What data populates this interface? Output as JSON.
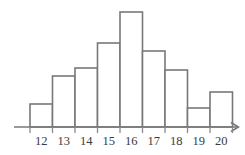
{
  "chart_data": {
    "type": "bar",
    "title": "",
    "subtitle": "",
    "xlabel": "",
    "ylabel": "",
    "categories": [
      "12",
      "13",
      "14",
      "15",
      "16",
      "17",
      "18",
      "19",
      "20"
    ],
    "values": [
      23,
      51,
      59,
      84,
      115,
      76,
      57,
      19,
      35
    ],
    "series": [
      {
        "name": "frequency",
        "values": [
          23,
          51,
          59,
          84,
          115,
          76,
          57,
          19,
          35
        ]
      }
    ],
    "x": [
      12,
      13,
      14,
      15,
      16,
      17,
      18,
      19,
      20
    ],
    "xlim": [
      11.5,
      20.5
    ],
    "ylim": [
      0,
      130
    ],
    "grid": false,
    "legend": null,
    "legend_position": "none",
    "annotations": [],
    "bar_style": "outlined",
    "bar_fill": "#ffffff",
    "bar_stroke": "#787878",
    "axis_color": "#787878",
    "tick_color": "#8a8a8a",
    "label_color": "#3a3a3a",
    "background": "#ffffff",
    "x_axis_has_arrow": true,
    "y_axis_shown": false,
    "tick_marks_between_bars": true
  },
  "axis": {
    "x_tick_labels": [
      "12",
      "13",
      "14",
      "15",
      "16",
      "17",
      "18",
      "19",
      "20"
    ],
    "arrow_label": "",
    "axis_name": "x-axis"
  },
  "geometry": {
    "baseline_y": 127,
    "bar_left_x": 30,
    "bar_width": 22.5,
    "bar_tops": [
      104,
      76,
      68,
      43,
      12,
      51,
      70,
      108,
      92
    ],
    "axis_start_x": 14,
    "axis_end_x": 238,
    "tick_height": 6,
    "label_y": 145
  }
}
